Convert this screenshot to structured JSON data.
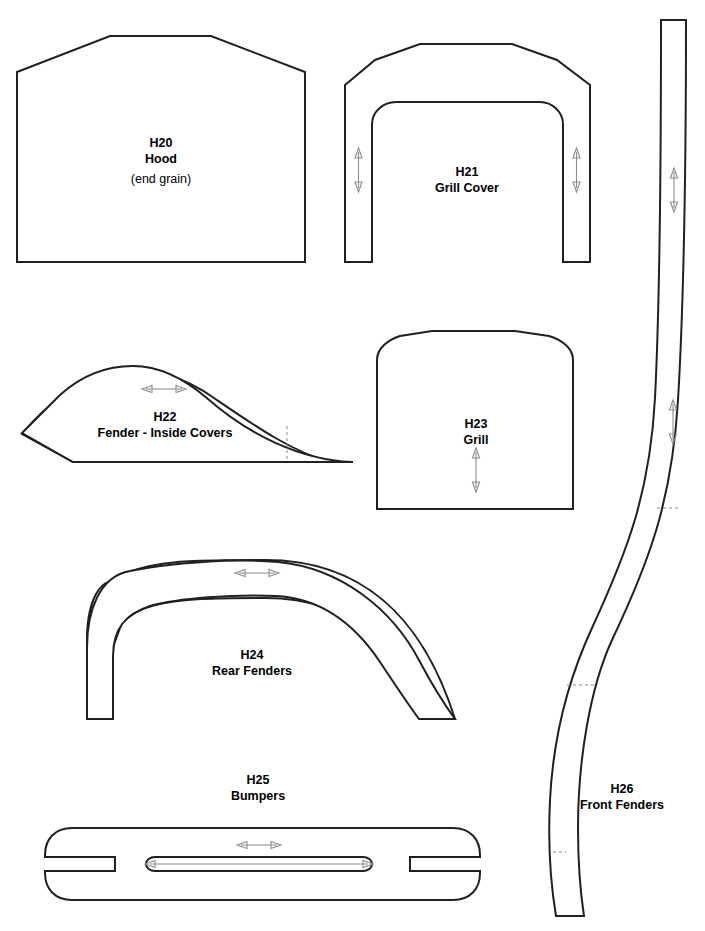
{
  "sheet": {
    "width": 705,
    "height": 931,
    "background": "#ffffff",
    "line_color": "#231f20",
    "arrow_color": "#8c8c8c",
    "dash_color": "#8a8a8a"
  },
  "pieces": [
    {
      "id": "H20",
      "code": "H20",
      "name": "Hood",
      "note": "(end grain)",
      "grain_arrow": "none",
      "label_x": 161,
      "label_y": 143,
      "shape": "flat-topped pentagon"
    },
    {
      "id": "H21",
      "code": "H21",
      "name": "Grill Cover",
      "note": "",
      "grain_arrow": "vertical",
      "label_x": 467,
      "label_y": 172,
      "shape": "inverted U arch band"
    },
    {
      "id": "H22",
      "code": "H22",
      "name": "Fender - Inside Covers",
      "note": "",
      "grain_arrow": "horizontal",
      "label_x": 165,
      "label_y": 417,
      "shape": "teardrop wedge"
    },
    {
      "id": "H23",
      "code": "H23",
      "name": "Grill",
      "note": "",
      "grain_arrow": "vertical",
      "label_x": 476,
      "label_y": 424,
      "shape": "round-topped rectangle"
    },
    {
      "id": "H24",
      "code": "H24",
      "name": "Rear Fenders",
      "note": "",
      "grain_arrow": "horizontal",
      "label_x": 252,
      "label_y": 655,
      "shape": "semicircular fender band"
    },
    {
      "id": "H25",
      "code": "H25",
      "name": "Bumpers",
      "note": "",
      "grain_arrow": "horizontal",
      "label_x": 258,
      "label_y": 780,
      "shape": "slotted rounded bar"
    },
    {
      "id": "H26",
      "code": "H26",
      "name": "Front Fenders",
      "note": "",
      "grain_arrow": "vertical",
      "label_x": 622,
      "label_y": 789,
      "shape": "long S-curved strip"
    }
  ],
  "labels": {
    "h20_code": "H20",
    "h20_name": "Hood",
    "h20_note": "(end grain)",
    "h21_code": "H21",
    "h21_name": "Grill Cover",
    "h22_code": "H22",
    "h22_name": "Fender - Inside Covers",
    "h23_code": "H23",
    "h23_name": "Grill",
    "h24_code": "H24",
    "h24_name": "Rear Fenders",
    "h25_code": "H25",
    "h25_name": "Bumpers",
    "h26_code": "H26",
    "h26_name": "Front Fenders"
  }
}
